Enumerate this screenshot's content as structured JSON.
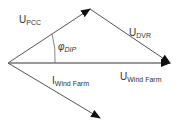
{
  "diagram": {
    "type": "phasor-diagram",
    "vectors": [
      {
        "id": "U_PCC",
        "main": "U",
        "sub": "PCC",
        "from": [
          8,
          63
        ],
        "to": [
          90,
          9
        ]
      },
      {
        "id": "U_DVR",
        "main": "U",
        "sub": "DVR",
        "from": [
          90,
          9
        ],
        "to": [
          170,
          63
        ]
      },
      {
        "id": "U_WindFarm",
        "main": "U",
        "sub": "Wind Farm",
        "from": [
          8,
          63
        ],
        "to": [
          170,
          63
        ]
      },
      {
        "id": "I_WindFarm",
        "main": "I",
        "sub": "Wind Farm",
        "from": [
          8,
          63
        ],
        "to": [
          100,
          118
        ]
      }
    ],
    "angle": {
      "main": "φ",
      "sub": "DIP"
    },
    "colors": {
      "line": "#555555",
      "arrow": "#111111",
      "text": "#333333"
    }
  }
}
